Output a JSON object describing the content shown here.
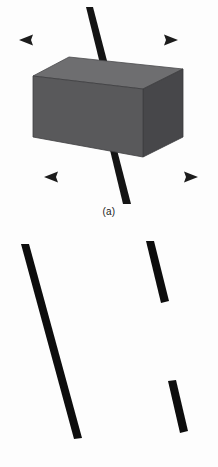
{
  "figure": {
    "background_color": "#fdfdfd",
    "width": 218,
    "height": 467
  },
  "panels": [
    {
      "id": "a",
      "caption": "(a)",
      "caption_color": "#1a1a1a",
      "elements": {
        "block": {
          "name": "rectangular-block",
          "front_face_color": "#59595b",
          "top_face_color": "#6e6e70",
          "side_face_color": "#47474a",
          "edge_color": "#3c3c3e",
          "front_face_points": "33,76 33,137 143,157 143,89",
          "top_face_points": "33,76 69,57 183,69 143,89",
          "side_face_points": "143,89 183,69 183,137 143,157"
        },
        "rod": {
          "name": "occluded-rod",
          "color": "#141414",
          "visible_segments": [
            {
              "x1": 89,
              "y1": 8,
              "x2": 107,
              "y2": 76,
              "width": 7
            },
            {
              "x1": 112,
              "y1": 148,
              "x2": 128,
              "y2": 203,
              "width": 7
            }
          ]
        },
        "arrows": [
          {
            "name": "arrow-top-left",
            "direction": "left",
            "x_tail": 85,
            "x_head": 20,
            "y": 40
          },
          {
            "name": "arrow-top-right",
            "direction": "right",
            "x_tail": 112,
            "x_head": 177,
            "y": 40
          },
          {
            "name": "arrow-bottom-left",
            "direction": "left",
            "x_tail": 110,
            "x_head": 45,
            "y": 177
          },
          {
            "name": "arrow-bottom-right",
            "direction": "right",
            "x_tail": 132,
            "x_head": 197,
            "y": 177
          }
        ],
        "arrow_color_dark": "#1c1c1c",
        "arrow_color_light": "#b9b9bb"
      }
    },
    {
      "id": "b",
      "caption": "(b)",
      "caption_color": "#1a1a1a",
      "elements": {
        "segments": [
          {
            "name": "segment-long-left",
            "x1": 25,
            "y1": 17,
            "x2": 78,
            "y2": 210,
            "width": 8,
            "color": "#0d0d0d"
          },
          {
            "name": "segment-upper-right",
            "x1": 150,
            "y1": 14,
            "x2": 165,
            "y2": 74,
            "width": 8,
            "color": "#0d0d0d"
          },
          {
            "name": "segment-lower-right",
            "x1": 172,
            "y1": 154,
            "x2": 184,
            "y2": 204,
            "width": 8,
            "color": "#0d0d0d"
          }
        ]
      }
    }
  ]
}
